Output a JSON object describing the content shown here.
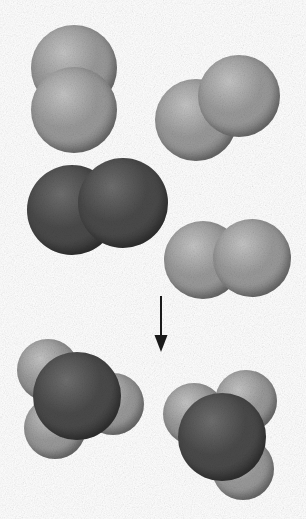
{
  "figure": {
    "width": 306,
    "height": 519,
    "background_color": "#ffffff",
    "type": "space-filling-molecular-model",
    "reaction_equation": "2 H2 + O2 -> 2 H2O"
  },
  "palette": {
    "hydrogen_light": "#9a9a9a",
    "hydrogen_light_highlight": "#c6c6c6",
    "hydrogen_light_shadow": "#6e6e6e",
    "oxygen_dark": "#4a4a4a",
    "oxygen_dark_highlight": "#6f6f6f",
    "oxygen_dark_shadow": "#2a2a2a",
    "arrow_color": "#1a1a1a",
    "background": "#ffffff"
  },
  "reactants": {
    "label": "reactants",
    "molecules": [
      {
        "id": "h2-top-left",
        "name": "hydrogen-molecule",
        "formula": "H2",
        "shade": "light",
        "orientation": "vertical",
        "atoms": [
          {
            "element": "H",
            "cx": 74,
            "cy": 68,
            "r": 43,
            "shade": "light"
          },
          {
            "element": "H",
            "cx": 74,
            "cy": 110,
            "r": 43,
            "shade": "light"
          }
        ]
      },
      {
        "id": "h2-top-right",
        "name": "hydrogen-molecule",
        "formula": "H2",
        "shade": "light",
        "orientation": "diagonal",
        "atoms": [
          {
            "element": "H",
            "cx": 196,
            "cy": 120,
            "r": 41,
            "shade": "light"
          },
          {
            "element": "H",
            "cx": 239,
            "cy": 96,
            "r": 41,
            "shade": "light"
          }
        ]
      },
      {
        "id": "o2-middle-left",
        "name": "oxygen-molecule",
        "formula": "O2",
        "shade": "dark",
        "orientation": "horizontal",
        "atoms": [
          {
            "element": "O",
            "cx": 72,
            "cy": 210,
            "r": 45,
            "shade": "dark"
          },
          {
            "element": "O",
            "cx": 123,
            "cy": 203,
            "r": 45,
            "shade": "dark"
          }
        ]
      },
      {
        "id": "h2-middle-right",
        "name": "hydrogen-molecule",
        "formula": "H2",
        "shade": "light",
        "orientation": "horizontal",
        "atoms": [
          {
            "element": "H",
            "cx": 203,
            "cy": 260,
            "r": 39,
            "shade": "light"
          },
          {
            "element": "H",
            "cx": 252,
            "cy": 258,
            "r": 39,
            "shade": "light"
          }
        ]
      }
    ]
  },
  "arrow": {
    "name": "reaction-arrow",
    "direction": "down",
    "x": 161,
    "y_start": 296,
    "y_end": 352,
    "shaft_width": 2,
    "head_width": 13,
    "head_height": 17,
    "color": "#1a1a1a"
  },
  "products": {
    "label": "products",
    "molecules": [
      {
        "id": "h2o-left",
        "name": "water-molecule",
        "formula": "H2O",
        "orientation": "bent",
        "atoms": [
          {
            "element": "H",
            "cx": 48,
            "cy": 370,
            "r": 31,
            "shade": "light"
          },
          {
            "element": "H",
            "cx": 113,
            "cy": 404,
            "r": 31,
            "shade": "light"
          },
          {
            "element": "H",
            "cx": 55,
            "cy": 428,
            "r": 31,
            "shade": "light"
          },
          {
            "element": "O",
            "cx": 77,
            "cy": 396,
            "r": 44,
            "shade": "dark"
          }
        ]
      },
      {
        "id": "h2o-right",
        "name": "water-molecule",
        "formula": "H2O",
        "orientation": "bent",
        "atoms": [
          {
            "element": "H",
            "cx": 194,
            "cy": 414,
            "r": 31,
            "shade": "light"
          },
          {
            "element": "H",
            "cx": 246,
            "cy": 401,
            "r": 31,
            "shade": "light"
          },
          {
            "element": "H",
            "cx": 243,
            "cy": 469,
            "r": 31,
            "shade": "light"
          },
          {
            "element": "O",
            "cx": 222,
            "cy": 437,
            "r": 44,
            "shade": "dark"
          }
        ]
      }
    ]
  }
}
